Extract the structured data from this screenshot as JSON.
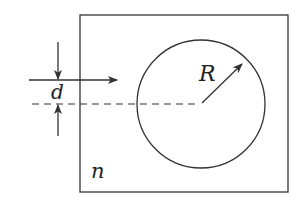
{
  "diagram": {
    "labels": {
      "radius": "R",
      "offset": "d",
      "refractive_index": "n"
    },
    "colors": {
      "stroke": "#333333",
      "background": "#ffffff"
    },
    "elements": [
      {
        "type": "rectangle",
        "role": "medium boundary"
      },
      {
        "type": "circle",
        "role": "cylinder cross-section"
      },
      {
        "type": "arrow",
        "role": "incident ray"
      },
      {
        "type": "dashed-line",
        "role": "axis through center"
      },
      {
        "type": "arrow",
        "role": "radius"
      },
      {
        "type": "dimension-arrows",
        "role": "offset d"
      }
    ]
  }
}
